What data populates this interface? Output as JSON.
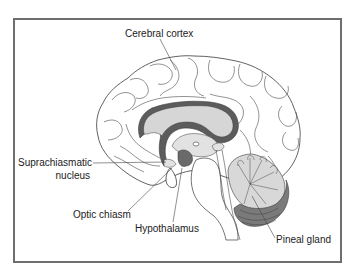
{
  "diagram": {
    "type": "anatomical-illustration",
    "labels": {
      "cerebral_cortex": "Cerebral cortex",
      "suprachiasmatic_line1": "Suprachiasmatic",
      "suprachiasmatic_line2": "nucleus",
      "optic_chiasm": "Optic chiasm",
      "hypothalamus": "Hypothalamus",
      "pineal_gland": "Pineal gland"
    },
    "colors": {
      "frame": "#6e6e6e",
      "line": "#3a3a3a",
      "light_fill": "#d6d6d6",
      "dark_fill": "#5c5c5c",
      "background": "#ffffff"
    }
  }
}
